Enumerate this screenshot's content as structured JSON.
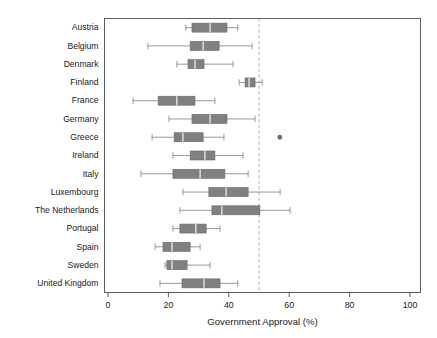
{
  "chart_data": {
    "type": "box",
    "title": "",
    "xlabel": "Government Approval (%)",
    "ylabel": "",
    "xlim": [
      0,
      100
    ],
    "xticks": [
      0,
      20,
      40,
      60,
      80,
      100
    ],
    "xtick_labels": [
      "0",
      "20",
      "40",
      "60",
      "80",
      "100"
    ],
    "grid": false,
    "legend": "none",
    "orientation": "horizontal",
    "reference_line": {
      "value": 50,
      "style": "dashed",
      "color": "#9a9a9a"
    },
    "box_color": "#808080",
    "median_color": "#ffffff",
    "categories": [
      "Austria",
      "Belgium",
      "Denmark",
      "Finland",
      "France",
      "Germany",
      "Greece",
      "Ireland",
      "Italy",
      "Luxembourg",
      "The Netherlands",
      "Portugal",
      "Spain",
      "Sweden",
      "United Kingdom"
    ],
    "boxes": [
      {
        "category": "Austria",
        "whisker_low": 25.8,
        "q1": 27.8,
        "median": 33.8,
        "q3": 39.4,
        "whisker_high": 43.0,
        "outliers": []
      },
      {
        "category": "Belgium",
        "whisker_low": 13.2,
        "q1": 27.2,
        "median": 31.5,
        "q3": 36.8,
        "whisker_high": 47.7,
        "outliers": []
      },
      {
        "category": "Denmark",
        "whisker_low": 22.8,
        "q1": 26.5,
        "median": 28.8,
        "q3": 31.8,
        "whisker_high": 41.4,
        "outliers": []
      },
      {
        "category": "Finland",
        "whisker_low": 43.4,
        "q1": 45.4,
        "median": 46.7,
        "q3": 48.7,
        "whisker_high": 51.0,
        "outliers": []
      },
      {
        "category": "France",
        "whisker_low": 8.3,
        "q1": 16.6,
        "median": 22.8,
        "q3": 28.8,
        "whisker_high": 35.4,
        "outliers": []
      },
      {
        "category": "Germany",
        "whisker_low": 20.2,
        "q1": 27.8,
        "median": 33.8,
        "q3": 39.4,
        "whisker_high": 48.7,
        "outliers": []
      },
      {
        "category": "Greece",
        "whisker_low": 14.6,
        "q1": 21.9,
        "median": 24.8,
        "q3": 31.5,
        "whisker_high": 38.4,
        "outliers": [
          56.9
        ]
      },
      {
        "category": "Ireland",
        "whisker_low": 21.5,
        "q1": 27.2,
        "median": 32.1,
        "q3": 35.4,
        "whisker_high": 44.7,
        "outliers": []
      },
      {
        "category": "Italy",
        "whisker_low": 10.9,
        "q1": 21.5,
        "median": 30.5,
        "q3": 38.7,
        "whisker_high": 46.4,
        "outliers": []
      },
      {
        "category": "Luxembourg",
        "whisker_low": 24.8,
        "q1": 33.4,
        "median": 39.1,
        "q3": 46.4,
        "whisker_high": 57.0,
        "outliers": []
      },
      {
        "category": "The Netherlands",
        "whisker_low": 23.8,
        "q1": 34.4,
        "median": 37.7,
        "q3": 50.3,
        "whisker_high": 60.3,
        "outliers": []
      },
      {
        "category": "Portugal",
        "whisker_low": 21.5,
        "q1": 23.8,
        "median": 29.1,
        "q3": 32.5,
        "whisker_high": 37.1,
        "outliers": []
      },
      {
        "category": "Spain",
        "whisker_low": 15.6,
        "q1": 18.2,
        "median": 21.2,
        "q3": 27.2,
        "whisker_high": 30.5,
        "outliers": []
      },
      {
        "category": "Sweden",
        "whisker_low": 18.9,
        "q1": 19.5,
        "median": 21.2,
        "q3": 26.2,
        "whisker_high": 33.8,
        "outliers": []
      },
      {
        "category": "United Kingdom",
        "whisker_low": 17.2,
        "q1": 24.5,
        "median": 31.8,
        "q3": 37.1,
        "whisker_high": 43.0,
        "outliers": []
      }
    ]
  }
}
